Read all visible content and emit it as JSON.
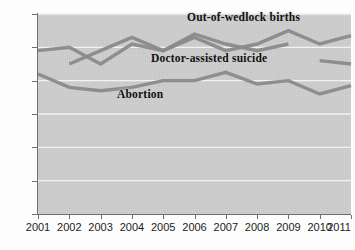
{
  "figure": {
    "clipped_top_text": "",
    "background_color": "#cdcdcd",
    "gridline_color": "#f2f2f2",
    "axis_color": "#6f6f6f",
    "line_color": "#8a8a8a",
    "label_color": "#111111"
  },
  "chart_data": {
    "type": "line",
    "title": "",
    "subtitle": "",
    "xlabel": "",
    "ylabel": "",
    "x": [
      2001,
      2002,
      2003,
      2004,
      2005,
      2006,
      2007,
      2008,
      2009,
      2010,
      2011
    ],
    "xtick_labels": [
      "2001",
      "2002",
      "2003",
      "2004",
      "2005",
      "2006",
      "2007",
      "2008",
      "2009",
      "2010",
      "2011"
    ],
    "xlim": [
      2001,
      2011
    ],
    "ylim": [
      0,
      60
    ],
    "ytick_labels": [
      "0",
      "10",
      "20",
      "30",
      "40",
      "50",
      "60"
    ],
    "yticks": [
      0,
      10,
      20,
      30,
      40,
      50,
      60
    ],
    "grid": "horizontal",
    "legend": "inline-labels",
    "series": [
      {
        "name": "Out-of-wedlock births",
        "label_position": "above-right",
        "color": "#8a8a8a",
        "x": [
          2001,
          2002,
          2003,
          2004,
          2005,
          2006,
          2007,
          2008,
          2009,
          2010,
          2011
        ],
        "values": [
          49,
          50,
          45,
          51,
          49,
          53,
          49,
          51,
          55,
          51,
          53.5
        ]
      },
      {
        "name": "Doctor-assisted suicide",
        "label_position": "middle-right",
        "color": "#8a8a8a",
        "x": [
          2002,
          2003,
          2004,
          2005,
          2006,
          2007,
          2008,
          2009,
          2010,
          2011
        ],
        "values": [
          45,
          49,
          53,
          49,
          54,
          51,
          49,
          51,
          null,
          null
        ],
        "segments": [
          {
            "x": [
              2002,
              2003,
              2004,
              2005,
              2006,
              2007,
              2008,
              2009
            ],
            "values": [
              45,
              49,
              53,
              49,
              54,
              51,
              49,
              51
            ]
          },
          {
            "x": [
              2010,
              2011
            ],
            "values": [
              46,
              45
            ]
          }
        ]
      },
      {
        "name": "Abortion",
        "label_position": "below-center",
        "color": "#8a8a8a",
        "x": [
          2001,
          2002,
          2003,
          2004,
          2005,
          2006,
          2007,
          2008,
          2009,
          2010,
          2011
        ],
        "values": [
          42,
          38,
          37,
          38,
          40,
          40,
          42.5,
          39,
          40,
          36,
          38.5
        ]
      }
    ]
  }
}
